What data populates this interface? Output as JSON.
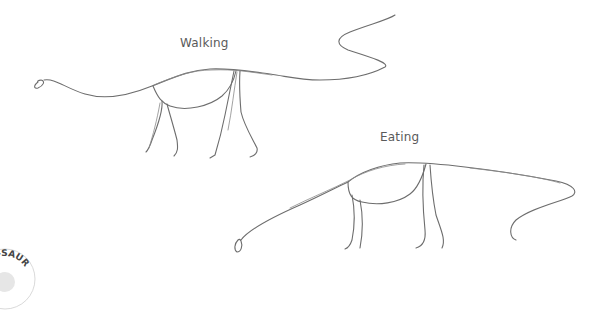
{
  "labels": {
    "walking": "Walking",
    "eating": "Eating"
  },
  "badge": {
    "text": "A-SAUR"
  },
  "colors": {
    "background": "#ffffff",
    "pencil": "#6d6d6d",
    "label": "#5a5a5a"
  }
}
